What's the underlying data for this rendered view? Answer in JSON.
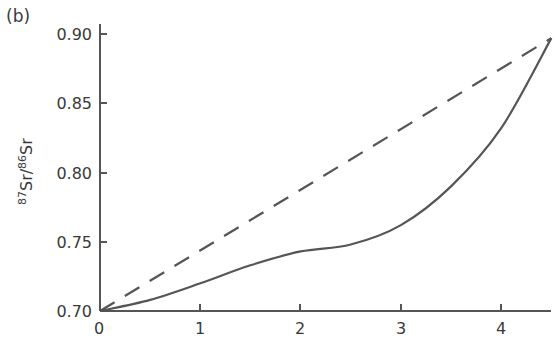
{
  "panel_label": "(b)",
  "chart_data": {
    "type": "line",
    "title": "",
    "xlabel": "",
    "ylabel": "87Sr/86Sr",
    "ylabel_parts": {
      "sup1": "87",
      "base1": "Sr/",
      "sup2": "86",
      "base2": "Sr"
    },
    "xlim": [
      0,
      4.5
    ],
    "ylim": [
      0.7,
      0.905
    ],
    "x_ticks": [
      "0",
      "1",
      "2",
      "3",
      "4"
    ],
    "y_ticks": [
      "0.70",
      "0.75",
      "0.80",
      "0.85",
      "0.90"
    ],
    "grid": false,
    "legend": null,
    "series": [
      {
        "name": "dashed (linear)",
        "style": "dashed",
        "color": "#555555",
        "x": [
          0,
          4.5
        ],
        "y": [
          0.7,
          0.897
        ]
      },
      {
        "name": "solid (curve)",
        "style": "solid",
        "color": "#555555",
        "x": [
          0,
          0.5,
          1.0,
          1.5,
          2.0,
          2.5,
          3.0,
          3.5,
          4.0,
          4.5
        ],
        "y": [
          0.7,
          0.708,
          0.72,
          0.733,
          0.743,
          0.748,
          0.762,
          0.79,
          0.832,
          0.897
        ]
      }
    ]
  }
}
